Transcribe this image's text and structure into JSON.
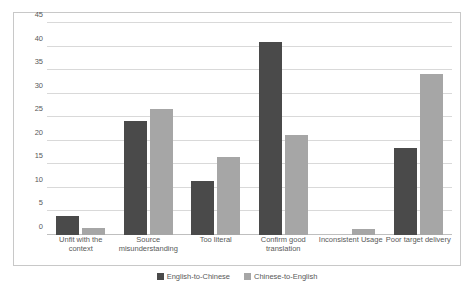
{
  "chart_data": {
    "type": "bar",
    "title": "",
    "subtitle": "",
    "xlabel": "",
    "ylabel": "",
    "ylim": [
      0,
      45
    ],
    "yticks": [
      0,
      5,
      10,
      15,
      20,
      25,
      30,
      35,
      40,
      45
    ],
    "grid": true,
    "legend_position": "bottom",
    "categories": [
      "Unfit with the context",
      "Source misunderstanding",
      "Too literal",
      "Confirm good translation",
      "Inconsistent Usage",
      "Poor target delivery"
    ],
    "series": [
      {
        "name": "English-to-Chinese",
        "color": "#4a4a4a",
        "values": [
          4,
          24.2,
          11.4,
          41,
          0,
          18.4
        ]
      },
      {
        "name": "Chinese-to-English",
        "color": "#a6a6a6",
        "values": [
          1.5,
          26.7,
          16.5,
          21.3,
          1.3,
          34.2
        ]
      }
    ]
  },
  "legend": {
    "items": [
      {
        "label": "English-to-Chinese"
      },
      {
        "label": "Chinese-to-English"
      }
    ]
  }
}
